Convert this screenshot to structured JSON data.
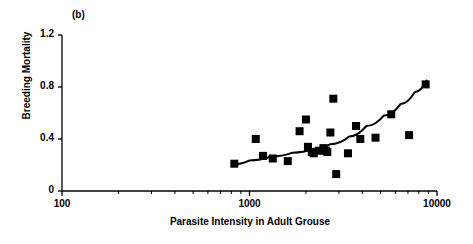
{
  "figure": {
    "panel_label": "(b)",
    "background_color": "#ffffff",
    "foreground_color": "#000000"
  },
  "chart_data": {
    "type": "scatter",
    "title": "",
    "subtitle": "",
    "panel": "(b)",
    "xlabel": "Parasite Intensity in Adult Grouse",
    "ylabel": "Breeding Mortality",
    "xscale": "log",
    "yscale": "linear",
    "xlim": [
      100,
      10000
    ],
    "ylim": [
      0,
      1.2
    ],
    "grid": false,
    "legend": false,
    "legend_position": "none",
    "xticks_major": [
      100,
      1000,
      10000
    ],
    "xtick_labels": [
      "100",
      "1000",
      "10000"
    ],
    "xticks_minor": [
      200,
      300,
      400,
      500,
      600,
      700,
      800,
      900,
      2000,
      3000,
      4000,
      5000,
      6000,
      7000,
      8000,
      9000
    ],
    "yticks": [
      0,
      0.4,
      0.8,
      1.2
    ],
    "ytick_labels": [
      "0",
      "0.4",
      "0.8",
      "1.2"
    ],
    "marker": "filled-square",
    "marker_color": "#000000",
    "marker_size_px": 8,
    "points": [
      {
        "x": 830,
        "y": 0.21
      },
      {
        "x": 1080,
        "y": 0.4
      },
      {
        "x": 1180,
        "y": 0.27
      },
      {
        "x": 1330,
        "y": 0.25
      },
      {
        "x": 1600,
        "y": 0.23
      },
      {
        "x": 1850,
        "y": 0.46
      },
      {
        "x": 2000,
        "y": 0.55
      },
      {
        "x": 2050,
        "y": 0.34
      },
      {
        "x": 2150,
        "y": 0.3
      },
      {
        "x": 2200,
        "y": 0.29
      },
      {
        "x": 2350,
        "y": 0.31
      },
      {
        "x": 2480,
        "y": 0.33
      },
      {
        "x": 2560,
        "y": 0.31
      },
      {
        "x": 2600,
        "y": 0.3
      },
      {
        "x": 2700,
        "y": 0.45
      },
      {
        "x": 2800,
        "y": 0.71
      },
      {
        "x": 2900,
        "y": 0.13
      },
      {
        "x": 3350,
        "y": 0.29
      },
      {
        "x": 3700,
        "y": 0.5
      },
      {
        "x": 3900,
        "y": 0.4
      },
      {
        "x": 4700,
        "y": 0.41
      },
      {
        "x": 5700,
        "y": 0.59
      },
      {
        "x": 7100,
        "y": 0.43
      },
      {
        "x": 8700,
        "y": 0.82
      }
    ],
    "fit_curve": {
      "label": "fitted trend",
      "style": "solid",
      "color": "#000000",
      "width_px": 2,
      "points": [
        {
          "x": 830,
          "y": 0.205
        },
        {
          "x": 1000,
          "y": 0.235
        },
        {
          "x": 1300,
          "y": 0.265
        },
        {
          "x": 1700,
          "y": 0.295
        },
        {
          "x": 2200,
          "y": 0.325
        },
        {
          "x": 2700,
          "y": 0.36
        },
        {
          "x": 3400,
          "y": 0.42
        },
        {
          "x": 4200,
          "y": 0.5
        },
        {
          "x": 5200,
          "y": 0.58
        },
        {
          "x": 6400,
          "y": 0.67
        },
        {
          "x": 7600,
          "y": 0.76
        },
        {
          "x": 8800,
          "y": 0.85
        }
      ]
    }
  }
}
